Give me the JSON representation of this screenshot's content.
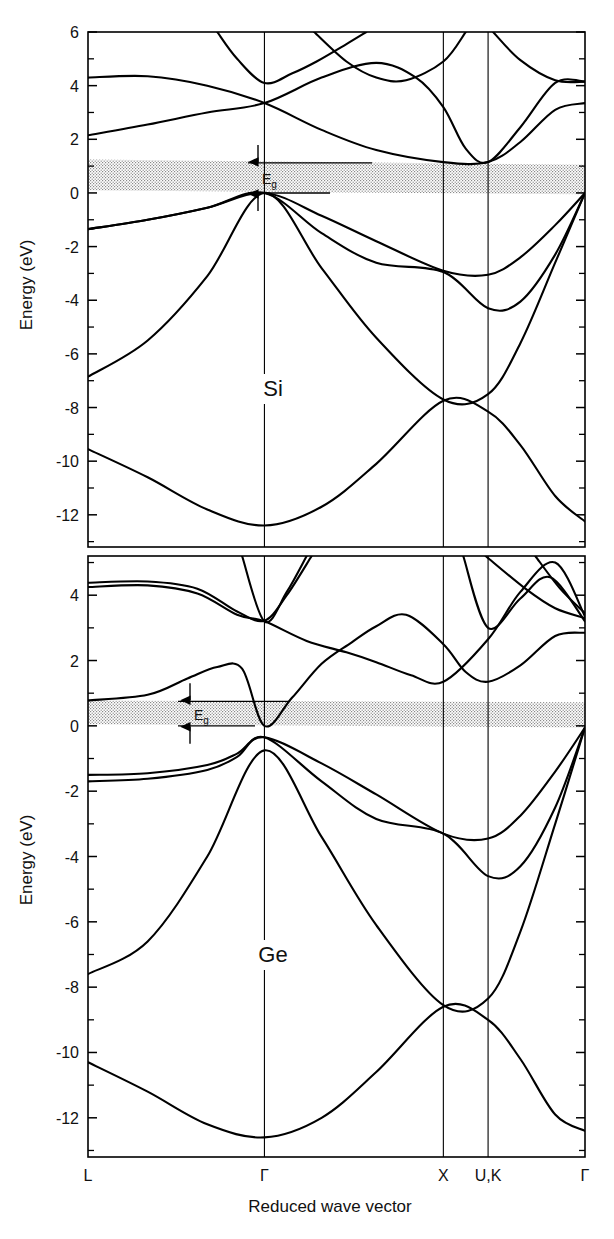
{
  "figure": {
    "axis_title_y": "Energy (eV)",
    "axis_title_x": "Reduced wave vector",
    "gap_label": "E",
    "gap_label_sub": "g"
  },
  "chart_data": [
    {
      "type": "line",
      "title": "Si",
      "panel": "top",
      "xlabel": "Reduced wave vector",
      "ylabel": "Energy (eV)",
      "ylim": [
        -13.2,
        6.0
      ],
      "xlim": [
        0,
        1
      ],
      "grid": false,
      "legend": "none",
      "ytick_major": [
        6,
        4,
        2,
        0,
        -2,
        -4,
        -6,
        -8,
        -10,
        -12
      ],
      "ytick_minor": [
        5,
        3,
        1,
        -1,
        -3,
        -5,
        -7,
        -9,
        -11,
        -13
      ],
      "xtick_labels": [
        "L",
        "Γ",
        "X",
        "U,K",
        "Γ"
      ],
      "xtick_positions": [
        0.0,
        0.355,
        0.715,
        0.805,
        1.0
      ],
      "band_gap": {
        "label": "Eg",
        "min_eV": 0.0,
        "max_eV": 1.12
      },
      "shaded_gap_band": {
        "left_top": 1.25,
        "left_bottom": 0.1,
        "right_top": 1.05,
        "right_bottom": -0.05
      },
      "annotations": [
        "Si",
        "Eg"
      ],
      "series": [
        {
          "name": "valence-band-1 (heavy hole)",
          "points_eV": [
            [
              0.0,
              -1.35
            ],
            [
              0.12,
              -1.0
            ],
            [
              0.24,
              -0.55
            ],
            [
              0.355,
              0.0
            ],
            [
              0.47,
              -0.85
            ],
            [
              0.58,
              -1.8
            ],
            [
              0.715,
              -2.9
            ],
            [
              0.805,
              -3.05
            ],
            [
              0.87,
              -2.4
            ],
            [
              0.94,
              -1.2
            ],
            [
              1.0,
              0.0
            ]
          ]
        },
        {
          "name": "valence-band-2 (light hole)",
          "points_eV": [
            [
              0.0,
              -1.35
            ],
            [
              0.12,
              -1.0
            ],
            [
              0.24,
              -0.55
            ],
            [
              0.355,
              0.0
            ],
            [
              0.47,
              -1.5
            ],
            [
              0.58,
              -2.6
            ],
            [
              0.715,
              -2.95
            ],
            [
              0.805,
              -4.3
            ],
            [
              0.87,
              -4.05
            ],
            [
              0.94,
              -2.3
            ],
            [
              1.0,
              0.0
            ]
          ]
        },
        {
          "name": "valence-band-3 (split off)",
          "points_eV": [
            [
              0.0,
              -6.85
            ],
            [
              0.12,
              -5.5
            ],
            [
              0.24,
              -3.1
            ],
            [
              0.355,
              0.0
            ],
            [
              0.47,
              -2.8
            ],
            [
              0.58,
              -5.4
            ],
            [
              0.715,
              -7.7
            ],
            [
              0.805,
              -7.5
            ],
            [
              0.87,
              -5.6
            ],
            [
              0.94,
              -2.6
            ],
            [
              1.0,
              0.0
            ]
          ]
        },
        {
          "name": "valence-band-4 (lowest)",
          "points_eV": [
            [
              0.0,
              -9.55
            ],
            [
              0.12,
              -10.6
            ],
            [
              0.24,
              -11.8
            ],
            [
              0.355,
              -12.4
            ],
            [
              0.47,
              -11.7
            ],
            [
              0.58,
              -10.1
            ],
            [
              0.715,
              -7.75
            ],
            [
              0.805,
              -8.15
            ],
            [
              0.87,
              -9.4
            ],
            [
              0.94,
              -11.3
            ],
            [
              1.0,
              -12.25
            ]
          ]
        },
        {
          "name": "conduction-band-1",
          "points_eV": [
            [
              0.0,
              4.3
            ],
            [
              0.12,
              4.35
            ],
            [
              0.24,
              4.0
            ],
            [
              0.355,
              3.35
            ],
            [
              0.47,
              2.35
            ],
            [
              0.58,
              1.6
            ],
            [
              0.715,
              1.15
            ],
            [
              0.805,
              1.15
            ],
            [
              0.87,
              1.9
            ],
            [
              0.94,
              3.1
            ],
            [
              1.0,
              3.35
            ]
          ]
        },
        {
          "name": "conduction-band-2",
          "points_eV": [
            [
              0.0,
              2.15
            ],
            [
              0.12,
              2.55
            ],
            [
              0.24,
              3.0
            ],
            [
              0.355,
              3.35
            ],
            [
              0.47,
              4.3
            ],
            [
              0.58,
              4.85
            ],
            [
              0.66,
              4.3
            ],
            [
              0.715,
              3.2
            ],
            [
              0.76,
              1.65
            ],
            [
              0.805,
              1.15
            ],
            [
              0.87,
              2.45
            ],
            [
              0.94,
              4.1
            ],
            [
              1.0,
              4.15
            ]
          ]
        },
        {
          "name": "conduction-band-3",
          "points_eV": [
            [
              0.26,
              6.0
            ],
            [
              0.3,
              5.0
            ],
            [
              0.355,
              4.1
            ],
            [
              0.41,
              4.45
            ],
            [
              0.46,
              4.9
            ],
            [
              0.52,
              5.55
            ],
            [
              0.56,
              6.0
            ]
          ]
        },
        {
          "name": "conduction-band-4",
          "points_eV": [
            [
              0.455,
              6.0
            ],
            [
              0.52,
              4.9
            ],
            [
              0.58,
              4.3
            ],
            [
              0.64,
              4.2
            ],
            [
              0.715,
              4.9
            ],
            [
              0.76,
              6.0
            ]
          ]
        },
        {
          "name": "conduction-band-5",
          "points_eV": [
            [
              0.815,
              6.0
            ],
            [
              0.87,
              4.95
            ],
            [
              0.94,
              4.2
            ],
            [
              1.0,
              4.15
            ]
          ]
        }
      ]
    },
    {
      "type": "line",
      "title": "Ge",
      "panel": "bottom",
      "xlabel": "Reduced wave vector",
      "ylabel": "Energy (eV)",
      "ylim": [
        -13.2,
        5.2
      ],
      "xlim": [
        0,
        1
      ],
      "grid": false,
      "legend": "none",
      "ytick_major": [
        4,
        2,
        0,
        -2,
        -4,
        -6,
        -8,
        -10,
        -12
      ],
      "ytick_minor": [
        5,
        3,
        1,
        -1,
        -3,
        -5,
        -7,
        -9,
        -11,
        -13
      ],
      "xtick_labels": [
        "L",
        "Γ",
        "X",
        "U,K",
        "Γ"
      ],
      "xtick_positions": [
        0.0,
        0.355,
        0.715,
        0.805,
        1.0
      ],
      "band_gap": {
        "label": "Eg",
        "min_eV": 0.0,
        "max_eV": 0.75
      },
      "shaded_gap_band": {
        "left_top": 0.78,
        "left_bottom": 0.05,
        "right_top": 0.72,
        "right_bottom": -0.05
      },
      "annotations": [
        "Ge",
        "Eg"
      ],
      "series": [
        {
          "name": "valence-band-1 (heavy hole)",
          "points_eV": [
            [
              0.0,
              -1.5
            ],
            [
              0.12,
              -1.45
            ],
            [
              0.24,
              -1.2
            ],
            [
              0.3,
              -0.85
            ],
            [
              0.355,
              -0.35
            ],
            [
              0.47,
              -1.15
            ],
            [
              0.58,
              -2.1
            ],
            [
              0.715,
              -3.3
            ],
            [
              0.805,
              -3.45
            ],
            [
              0.87,
              -2.75
            ],
            [
              0.94,
              -1.4
            ],
            [
              1.0,
              -0.05
            ]
          ]
        },
        {
          "name": "valence-band-2 (light hole)",
          "points_eV": [
            [
              0.0,
              -1.7
            ],
            [
              0.12,
              -1.62
            ],
            [
              0.24,
              -1.35
            ],
            [
              0.3,
              -0.95
            ],
            [
              0.355,
              -0.35
            ],
            [
              0.47,
              -1.7
            ],
            [
              0.58,
              -2.85
            ],
            [
              0.715,
              -3.3
            ],
            [
              0.805,
              -4.6
            ],
            [
              0.87,
              -4.3
            ],
            [
              0.94,
              -2.5
            ],
            [
              1.0,
              -0.05
            ]
          ]
        },
        {
          "name": "valence-band-3 (split off)",
          "points_eV": [
            [
              0.0,
              -7.6
            ],
            [
              0.12,
              -6.6
            ],
            [
              0.24,
              -4.0
            ],
            [
              0.355,
              -0.75
            ],
            [
              0.47,
              -3.4
            ],
            [
              0.58,
              -6.1
            ],
            [
              0.715,
              -8.55
            ],
            [
              0.805,
              -8.35
            ],
            [
              0.87,
              -6.3
            ],
            [
              0.94,
              -3.0
            ],
            [
              1.0,
              -0.05
            ]
          ]
        },
        {
          "name": "valence-band-4 (lowest)",
          "points_eV": [
            [
              0.0,
              -10.3
            ],
            [
              0.12,
              -11.2
            ],
            [
              0.24,
              -12.2
            ],
            [
              0.355,
              -12.6
            ],
            [
              0.47,
              -12.0
            ],
            [
              0.58,
              -10.6
            ],
            [
              0.715,
              -8.6
            ],
            [
              0.805,
              -9.0
            ],
            [
              0.87,
              -10.2
            ],
            [
              0.94,
              -11.9
            ],
            [
              1.0,
              -12.4
            ]
          ]
        },
        {
          "name": "conduction-band-1 (L valley)",
          "points_eV": [
            [
              0.0,
              0.78
            ],
            [
              0.12,
              0.95
            ],
            [
              0.2,
              1.45
            ],
            [
              0.26,
              1.8
            ],
            [
              0.31,
              1.75
            ],
            [
              0.355,
              0.0
            ],
            [
              0.41,
              0.85
            ],
            [
              0.47,
              1.9
            ],
            [
              0.53,
              2.55
            ],
            [
              0.58,
              3.05
            ],
            [
              0.64,
              3.4
            ],
            [
              0.715,
              2.5
            ],
            [
              0.76,
              1.65
            ],
            [
              0.805,
              1.35
            ],
            [
              0.87,
              1.85
            ],
            [
              0.94,
              2.75
            ],
            [
              1.0,
              2.85
            ]
          ]
        },
        {
          "name": "conduction-band-2",
          "points_eV": [
            [
              0.0,
              4.25
            ],
            [
              0.12,
              4.3
            ],
            [
              0.22,
              4.05
            ],
            [
              0.3,
              3.4
            ],
            [
              0.355,
              3.2
            ],
            [
              0.44,
              2.6
            ],
            [
              0.52,
              2.25
            ],
            [
              0.58,
              1.95
            ],
            [
              0.65,
              1.55
            ],
            [
              0.715,
              1.35
            ],
            [
              0.805,
              2.65
            ],
            [
              0.87,
              4.1
            ],
            [
              0.94,
              5.0
            ],
            [
              1.0,
              3.35
            ]
          ]
        },
        {
          "name": "conduction-band-3",
          "points_eV": [
            [
              0.0,
              4.38
            ],
            [
              0.12,
              4.42
            ],
            [
              0.22,
              4.2
            ],
            [
              0.3,
              3.5
            ],
            [
              0.355,
              3.22
            ],
            [
              0.4,
              4.0
            ],
            [
              0.45,
              5.2
            ]
          ]
        },
        {
          "name": "conduction-band-4",
          "points_eV": [
            [
              0.31,
              5.2
            ],
            [
              0.355,
              3.2
            ],
            [
              0.4,
              4.1
            ],
            [
              0.44,
              5.2
            ]
          ]
        },
        {
          "name": "conduction-band-5",
          "points_eV": [
            [
              0.755,
              5.2
            ],
            [
              0.805,
              3.0
            ],
            [
              0.87,
              3.9
            ],
            [
              0.93,
              4.55
            ],
            [
              1.0,
              3.2
            ]
          ]
        },
        {
          "name": "conduction-band-6",
          "points_eV": [
            [
              0.8,
              5.2
            ],
            [
              0.88,
              4.2
            ],
            [
              0.94,
              3.6
            ],
            [
              1.0,
              3.3
            ]
          ]
        },
        {
          "name": "conduction-band-7",
          "points_eV": [
            [
              0.9,
              5.2
            ],
            [
              0.95,
              4.2
            ],
            [
              1.0,
              3.45
            ]
          ]
        }
      ]
    }
  ]
}
